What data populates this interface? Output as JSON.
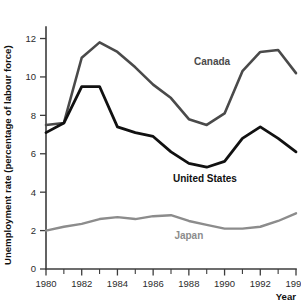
{
  "chart_data": {
    "type": "line",
    "title": "",
    "xlabel": "Year",
    "ylabel": "Unemployment rate (percentage of labour force)",
    "x": [
      1980,
      1981,
      1982,
      1983,
      1984,
      1985,
      1986,
      1987,
      1988,
      1989,
      1990,
      1991,
      1992,
      1993,
      1994
    ],
    "xlim": [
      1980,
      1994
    ],
    "ylim": [
      0,
      12.6
    ],
    "grid": false,
    "legend_position": "inline-annotations",
    "x_tick_labels": [
      "1980",
      "1982",
      "1984",
      "1986",
      "1988",
      "1990",
      "1992",
      "1994"
    ],
    "x_major_ticks": [
      1980,
      1982,
      1984,
      1986,
      1988,
      1990,
      1992,
      1994
    ],
    "x_minor_ticks": [
      1981,
      1983,
      1985,
      1987,
      1989,
      1991,
      1993
    ],
    "y_tick_labels": [
      "0",
      "2",
      "4",
      "6",
      "8",
      "10",
      "12"
    ],
    "y_ticks": [
      0,
      2,
      4,
      6,
      8,
      10,
      12
    ],
    "series": [
      {
        "name": "Canada",
        "color": "#4a4a4a",
        "stroke_width": 2.6,
        "values": [
          7.5,
          7.6,
          11.0,
          11.8,
          11.3,
          10.5,
          9.6,
          8.9,
          7.8,
          7.5,
          8.1,
          10.3,
          11.3,
          11.4,
          10.2
        ],
        "label_x": 1989.3,
        "label_y": 10.6
      },
      {
        "name": "United States",
        "color": "#111111",
        "stroke_width": 2.8,
        "values": [
          7.1,
          7.6,
          9.5,
          9.5,
          7.4,
          7.1,
          6.9,
          6.1,
          5.5,
          5.3,
          5.6,
          6.8,
          7.4,
          6.8,
          6.1
        ],
        "label_x": 1988.9,
        "label_y": 4.55
      },
      {
        "name": "Japan",
        "color": "#8c8c8c",
        "stroke_width": 2.4,
        "values": [
          2.0,
          2.2,
          2.35,
          2.6,
          2.7,
          2.6,
          2.75,
          2.8,
          2.5,
          2.3,
          2.1,
          2.1,
          2.2,
          2.5,
          2.9
        ],
        "label_x": 1988.0,
        "label_y": 1.55
      }
    ]
  }
}
